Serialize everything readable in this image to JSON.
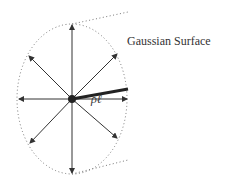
{
  "diagram": {
    "title_label": "Gaussian Surface",
    "radius_label": "ρℓ",
    "colors": {
      "stroke": "#333333",
      "dotted": "#777777"
    }
  }
}
